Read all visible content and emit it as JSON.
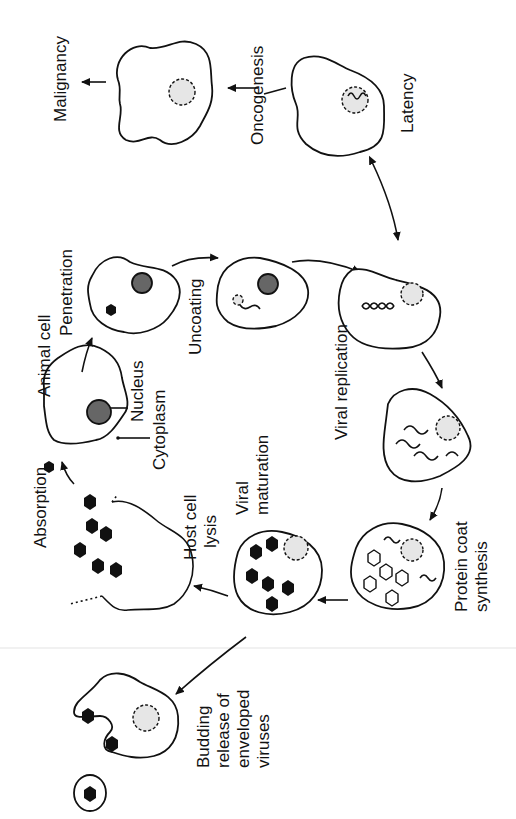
{
  "diagram": {
    "orientation": "rotated 90 degrees counter-clockwise",
    "labels": {
      "malignancy": "Malignancy",
      "oncogenesis": "Oncogenesis",
      "latency": "Latency",
      "penetration": "Penetration",
      "uncoating": "Uncoating",
      "animal_cell": "Animal cell",
      "nucleus": "Nucleus",
      "cytoplasm": "Cytoplasm",
      "absorption": "Absorption",
      "viral_replication": "Viral replication",
      "viral_maturation_1": "Viral",
      "viral_maturation_2": "maturation",
      "host_cell_lysis_1": "Host cell",
      "host_cell_lysis_2": "lysis",
      "protein_coat_1": "Protein coat",
      "protein_coat_2": "synthesis",
      "budding_1": "Budding",
      "budding_2": "release of",
      "budding_3": "enveloped",
      "budding_4": "viruses"
    },
    "stages": [
      {
        "name": "Absorption"
      },
      {
        "name": "Penetration"
      },
      {
        "name": "Uncoating"
      },
      {
        "name": "Viral replication"
      },
      {
        "name": "Protein coat synthesis"
      },
      {
        "name": "Viral maturation"
      },
      {
        "name": "Host cell lysis"
      },
      {
        "name": "Budding release of enveloped viruses"
      },
      {
        "name": "Latency"
      },
      {
        "name": "Oncogenesis"
      },
      {
        "name": "Malignancy"
      }
    ]
  }
}
